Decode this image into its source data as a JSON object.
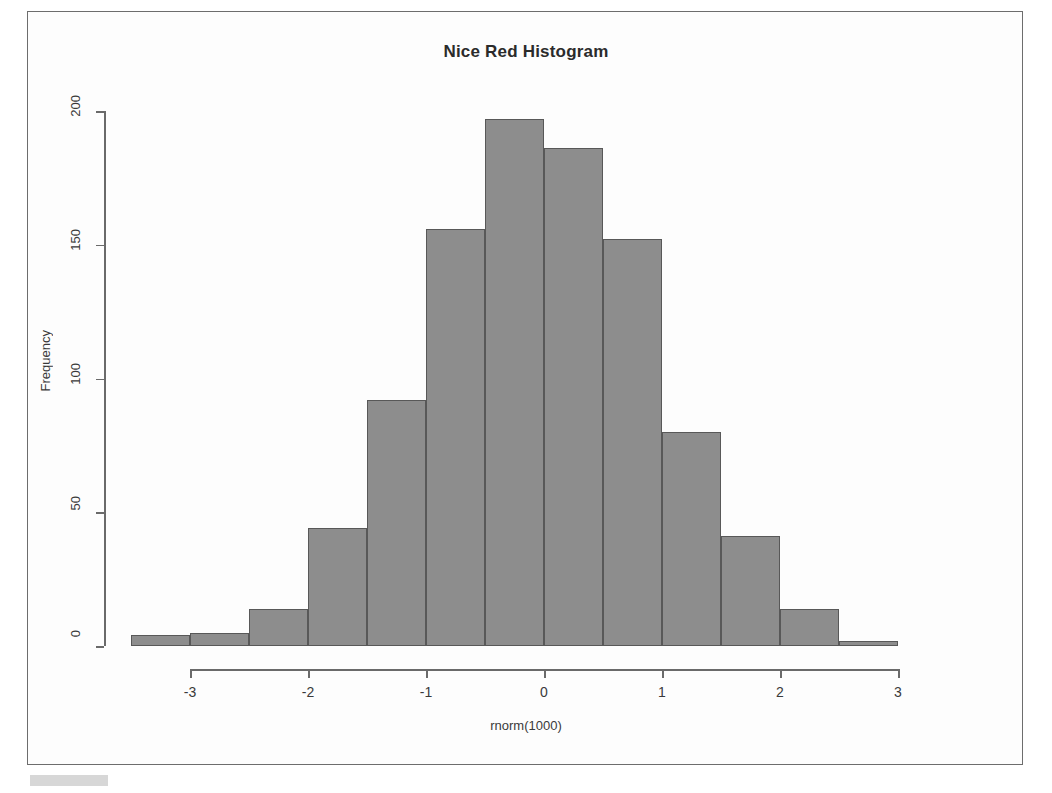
{
  "figure": {
    "title": "Nice Red Histogram",
    "frame_border_color": "#6d6d6d",
    "background_color": "#ffffff"
  },
  "axes": {
    "x_title": "rnorm(1000)",
    "y_title": "Frequency",
    "x_ticks": [
      "-3",
      "-2",
      "-1",
      "0",
      "1",
      "2",
      "3"
    ],
    "y_ticks": [
      "0",
      "50",
      "100",
      "150",
      "200"
    ],
    "axis_color": "#6a6a6a"
  },
  "chart_data": {
    "type": "bar",
    "title": "Nice Red Histogram",
    "subtitle": "",
    "xlabel": "rnorm(1000)",
    "ylabel": "Frequency",
    "xlim": [
      -3.5,
      3.0
    ],
    "ylim": [
      0,
      200
    ],
    "grid": false,
    "legend": "none",
    "bin_width": 0.5,
    "bar_fill_color": "#8d8d8d",
    "bar_border_color": "#585858",
    "bin_edges": [
      -3.5,
      -3.0,
      -2.5,
      -2.0,
      -1.5,
      -1.0,
      -0.5,
      0.0,
      0.5,
      1.0,
      1.5,
      2.0,
      2.5,
      3.0
    ],
    "categories": [
      "[-3.5,-3.0)",
      "[-3.0,-2.5)",
      "[-2.5,-2.0)",
      "[-2.0,-1.5)",
      "[-1.5,-1.0)",
      "[-1.0,-0.5)",
      "[-0.5,0.0)",
      "[0.0,0.5)",
      "[0.5,1.0)",
      "[1.0,1.5)",
      "[1.5,2.0)",
      "[2.0,2.5)",
      "[2.5,3.0)"
    ],
    "values": [
      4,
      5,
      14,
      44,
      92,
      156,
      197,
      186,
      152,
      80,
      41,
      14,
      2
    ],
    "x_tick_values": [
      -3,
      -2,
      -1,
      0,
      1,
      2,
      3
    ],
    "y_tick_values": [
      0,
      50,
      100,
      150,
      200
    ]
  }
}
